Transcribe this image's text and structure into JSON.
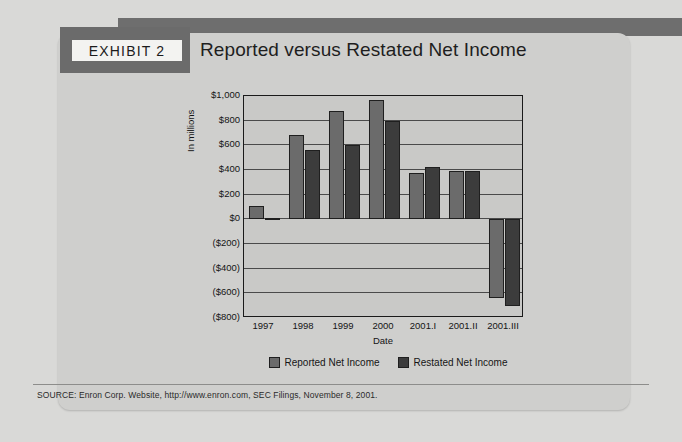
{
  "exhibit": {
    "badge_label": "EXHIBIT 2",
    "title": "Reported versus Restated Net Income"
  },
  "source": {
    "text": "SOURCE: Enron Corp. Website, http://www.enron.com, SEC Filings, November 8, 2001."
  },
  "colors": {
    "page_background": "#d9d9d7",
    "card_background": "#cfcfcd",
    "plot_background": "#c9c9c7",
    "reported_bar": "#6b6b6b",
    "restated_bar": "#3c3c3c",
    "axis_line": "#1a1a1a",
    "dark_block": "#6b6b6b"
  },
  "chart_data": {
    "type": "bar",
    "title": "Reported versus Restated Net Income",
    "xlabel": "Date",
    "ylabel": "In millions",
    "categories": [
      "1997",
      "1998",
      "1999",
      "2000",
      "2001.I",
      "2001.II",
      "2001.III"
    ],
    "series": [
      {
        "name": "Reported Net Income",
        "color": "#6b6b6b",
        "values": [
          105,
          680,
          875,
          970,
          375,
          390,
          -640
        ]
      },
      {
        "name": "Restated Net Income",
        "color": "#3c3c3c",
        "values": [
          9,
          560,
          600,
          800,
          425,
          390,
          -700
        ]
      }
    ],
    "ylim": [
      -800,
      1000
    ],
    "ytick_values": [
      1000,
      800,
      600,
      400,
      200,
      0,
      -200,
      -400,
      -600,
      -800
    ],
    "ytick_labels": [
      "$1,000",
      "$800",
      "$600",
      "$400",
      "$200",
      "$0",
      "($200)",
      "($400)",
      "($600)",
      "($800)"
    ],
    "grid": true,
    "legend_position": "bottom"
  }
}
